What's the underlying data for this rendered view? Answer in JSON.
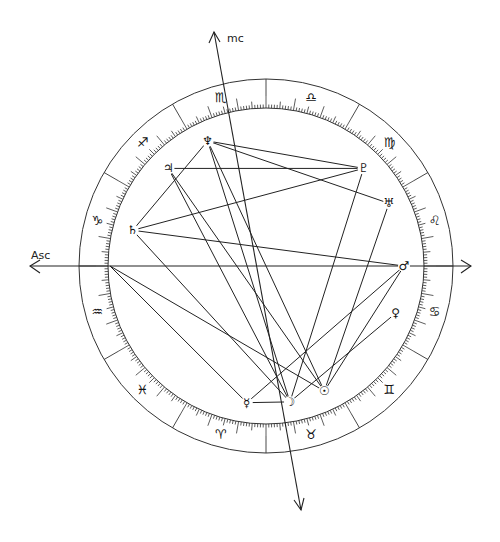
{
  "chart_data": {
    "type": "natal-chart-wheel",
    "title": "",
    "axes": {
      "asc_label": "Asc",
      "mc_label": "mc"
    },
    "zodiac_signs": [
      {
        "name": "aries",
        "glyph": "♈"
      },
      {
        "name": "taurus",
        "glyph": "♉"
      },
      {
        "name": "gemini",
        "glyph": "♊"
      },
      {
        "name": "cancer",
        "glyph": "♋"
      },
      {
        "name": "leo",
        "glyph": "♌"
      },
      {
        "name": "virgo",
        "glyph": "♍"
      },
      {
        "name": "libra",
        "glyph": "♎"
      },
      {
        "name": "scorpio",
        "glyph": "♏"
      },
      {
        "name": "sagittarius",
        "glyph": "♐"
      },
      {
        "name": "capricorn",
        "glyph": "♑"
      },
      {
        "name": "aquarius",
        "glyph": "♒"
      },
      {
        "name": "pisces",
        "glyph": "♓"
      }
    ],
    "ascendant_sign": "aquarius",
    "ascendant_degree_in_sign": 0,
    "mc_longitude_deg": 227,
    "planets": [
      {
        "name": "neptune",
        "glyph": "♆",
        "longitude_deg": 235
      },
      {
        "name": "jupiter",
        "glyph": "♃",
        "longitude_deg": 255
      },
      {
        "name": "saturn",
        "glyph": "♄",
        "longitude_deg": 285
      },
      {
        "name": "pluto",
        "glyph": "♇",
        "longitude_deg": 165
      },
      {
        "name": "uranus",
        "glyph": "♅",
        "longitude_deg": 147
      },
      {
        "name": "mars",
        "glyph": "♂",
        "longitude_deg": 120
      },
      {
        "name": "venus",
        "glyph": "♀",
        "longitude_deg": 100
      },
      {
        "name": "moon",
        "glyph": "☽",
        "longitude_deg": 40
      },
      {
        "name": "mercury",
        "glyph": "☿",
        "longitude_deg": 22
      },
      {
        "name": "sun",
        "glyph": "☉",
        "longitude_deg": 55
      }
    ],
    "aspects": [
      {
        "from": "saturn",
        "to": "neptune"
      },
      {
        "from": "saturn",
        "to": "pluto"
      },
      {
        "from": "saturn",
        "to": "mars"
      },
      {
        "from": "saturn",
        "to": "moon"
      },
      {
        "from": "jupiter",
        "to": "pluto"
      },
      {
        "from": "jupiter",
        "to": "moon"
      },
      {
        "from": "jupiter",
        "to": "sun"
      },
      {
        "from": "neptune",
        "to": "moon"
      },
      {
        "from": "neptune",
        "to": "sun"
      },
      {
        "from": "neptune",
        "to": "uranus"
      },
      {
        "from": "neptune",
        "to": "pluto"
      },
      {
        "from": "asc",
        "to": "mercury"
      },
      {
        "from": "asc",
        "to": "sun"
      },
      {
        "from": "pluto",
        "to": "moon"
      },
      {
        "from": "uranus",
        "to": "sun"
      },
      {
        "from": "mars",
        "to": "mercury"
      },
      {
        "from": "mars",
        "to": "sun"
      },
      {
        "from": "moon",
        "to": "venus"
      },
      {
        "from": "mercury",
        "to": "moon"
      }
    ]
  }
}
